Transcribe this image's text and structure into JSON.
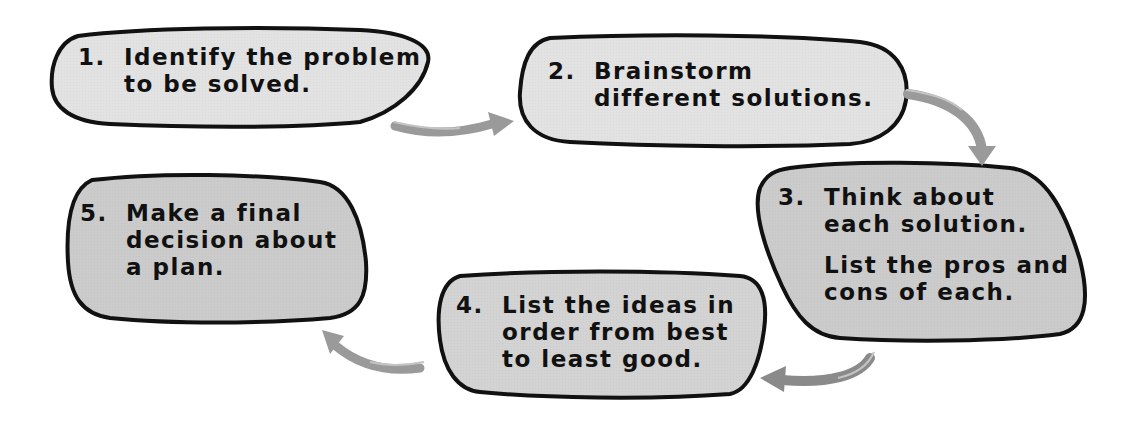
{
  "diagram": {
    "type": "process-cycle",
    "colors": {
      "bubble_fill_light": "#e2e2e2",
      "bubble_fill_dark": "#cbcbcb",
      "outline": "#111111",
      "arrow": "#9a9a9a",
      "text": "#111111"
    },
    "steps": [
      {
        "number": "1.",
        "lines": [
          "Identify the problem",
          "to be solved."
        ]
      },
      {
        "number": "2.",
        "lines": [
          "Brainstorm",
          "different solutions."
        ]
      },
      {
        "number": "3.",
        "lines": [
          "Think about",
          "each solution."
        ],
        "extra_lines": [
          "List the pros and",
          "cons of each."
        ]
      },
      {
        "number": "4.",
        "lines": [
          "List the ideas in",
          "order from best",
          "to least good."
        ]
      },
      {
        "number": "5.",
        "lines": [
          "Make a final",
          "decision about",
          "a plan."
        ]
      }
    ],
    "arrows": [
      {
        "from": "1",
        "to": "2",
        "direction": "right"
      },
      {
        "from": "2",
        "to": "3",
        "direction": "down"
      },
      {
        "from": "3",
        "to": "4",
        "direction": "left"
      },
      {
        "from": "4",
        "to": "5",
        "direction": "up-left"
      }
    ]
  }
}
